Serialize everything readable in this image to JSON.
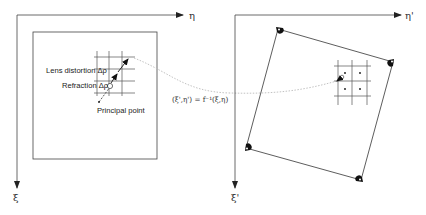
{
  "left_panel": {
    "axis_h_label": "η",
    "axis_v_label": "ξ",
    "labels": {
      "lens_distortion": "Lens distortion Δρ",
      "refraction": "Refraction Δρ",
      "principal_point": "Principal point"
    }
  },
  "transform": {
    "equation": "(ξ',η') = f⁻¹(ξ,η)"
  },
  "right_panel": {
    "axis_h_label": "η'",
    "axis_v_label": "ξ'"
  },
  "colors": {
    "line": "#333333",
    "grid": "#555555",
    "dotted_curve": "#bbbbbb"
  }
}
